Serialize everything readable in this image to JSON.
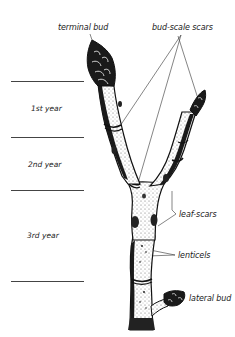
{
  "diagram": {
    "labels": {
      "terminal_bud": "terminal bud",
      "bud_scale_scars": "bud-scale scars",
      "leaf_scars": "leaf-scars",
      "lenticels": "lenticels",
      "lateral_bud": "lateral bud"
    },
    "growth_years": [
      {
        "label": "1st year"
      },
      {
        "label": "2nd year"
      },
      {
        "label": "3rd year"
      }
    ],
    "colors": {
      "ink": "#111111",
      "background": "#ffffff",
      "leader_line": "#333333",
      "divider_line": "#444444"
    }
  }
}
